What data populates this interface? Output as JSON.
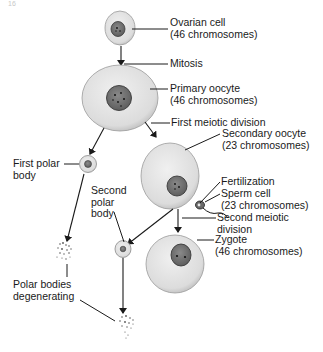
{
  "figure": {
    "page_fragment": "16",
    "labels": {
      "ovarian_cell": [
        "Ovarian cell",
        "(46 chromosomes)"
      ],
      "mitosis": "Mitosis",
      "primary_oocyte": [
        "Primary oocyte",
        "(46 chromosomes)"
      ],
      "first_meiotic_division": "First meiotic division",
      "secondary_oocyte": [
        "Secondary oocyte",
        "(23 chromosomes)"
      ],
      "first_polar_body": [
        "First polar",
        "body"
      ],
      "fertilization": "Fertilization",
      "sperm_cell": [
        "Sperm cell",
        "(23 chromosomes)"
      ],
      "second_polar_body": [
        "Second",
        "polar",
        "body"
      ],
      "second_meiotic_division": [
        "Second meiotic",
        "division"
      ],
      "zygote": [
        "Zygote",
        "(46 chromosomes)"
      ],
      "polar_bodies_degenerating": [
        "Polar bodies",
        "degenerating"
      ]
    },
    "colors": {
      "ink": "#1a1a1a",
      "cytoplasm": "#e6e6e6",
      "cytoplasm_edge": "#9a9a9a",
      "nucleus": "#7a7a7a",
      "nucleus_edge": "#3a3a3a"
    }
  }
}
